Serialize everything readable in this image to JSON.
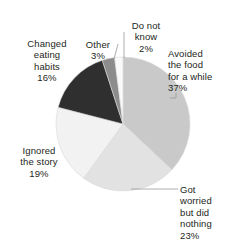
{
  "chart_data": {
    "type": "pie",
    "title": "",
    "subtitle": "",
    "xlabel": "",
    "ylabel": "",
    "legend_position": "none",
    "grid": false,
    "start_angle_deg": 0,
    "direction": "clockwise",
    "categories": [
      "Avoided the food for a while",
      "Got worried but did nothing",
      "Ignored the story",
      "Changed eating habits",
      "Other",
      "Do not know"
    ],
    "values": [
      37,
      23,
      19,
      16,
      3,
      2
    ],
    "value_unit": "%",
    "slices": [
      {
        "id": "avoided",
        "label": "Avoided\nthe food\nfor a while",
        "label_flat": "Avoided the food for a while",
        "value": 37,
        "value_label": "37%",
        "color": "#c9c9c9",
        "leader": true
      },
      {
        "id": "got-worried",
        "label": "Got\nworried\nbut did\nnothing",
        "label_flat": "Got worried but did nothing",
        "value": 23,
        "value_label": "23%",
        "color": "#e2e2e2",
        "leader": true
      },
      {
        "id": "ignored",
        "label": "Ignored\nthe story",
        "label_flat": "Ignored the story",
        "value": 19,
        "value_label": "19%",
        "color": "#f2f2f2",
        "leader": false
      },
      {
        "id": "changed",
        "label": "Changed\neating\nhabits",
        "label_flat": "Changed eating habits",
        "value": 16,
        "value_label": "16%",
        "color": "#2f2f2f",
        "leader": false
      },
      {
        "id": "other",
        "label": "Other",
        "label_flat": "Other",
        "value": 3,
        "value_label": "3%",
        "color": "#8c8c8c",
        "leader": true
      },
      {
        "id": "do-not-know",
        "label": "Do not\nknow",
        "label_flat": "Do not know",
        "value": 2,
        "value_label": "2%",
        "color": "#fafafa",
        "leader": true
      }
    ],
    "geometry": {
      "center_x": 123,
      "center_y": 124,
      "radius": 67
    },
    "colors": {
      "text": "#231f20",
      "leader_line": "#9a9a9a",
      "slice_outline": "#d8d8d8",
      "background": "#ffffff"
    }
  }
}
